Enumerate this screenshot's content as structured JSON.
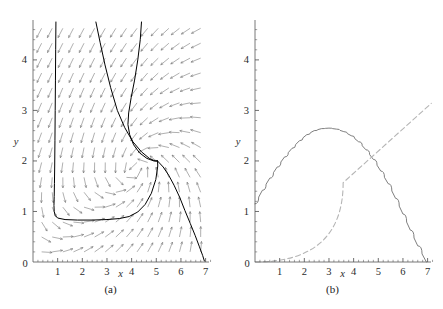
{
  "figure": {
    "background_color": "#ffffff",
    "panels": [
      {
        "id": "a",
        "caption": "(a)",
        "type": "phase-portrait",
        "xlabel": "x",
        "ylabel": "y",
        "xlim": [
          0,
          7.3
        ],
        "ylim": [
          0,
          4.75
        ],
        "xticks": [
          0,
          1,
          2,
          3,
          4,
          5,
          6,
          7
        ],
        "xtick_labels": [
          "0",
          "1",
          "2",
          "3",
          "4",
          "5",
          "6",
          "7"
        ],
        "yticks": [
          0,
          1,
          2,
          3,
          4
        ],
        "ytick_labels": [
          "0",
          "1",
          "2",
          "3",
          "4"
        ],
        "minor_ticks": true,
        "grid": false,
        "vector_field_color": "#6e6e6e",
        "trajectory_color": "#000000",
        "axis_color": "#555555",
        "equilibrium_point": [
          5.05,
          2.0
        ]
      },
      {
        "id": "b",
        "caption": "(b)",
        "type": "line",
        "xlabel": "x",
        "ylabel": "y",
        "xlim": [
          0,
          7.3
        ],
        "ylim": [
          0,
          4.75
        ],
        "xticks": [
          0,
          1,
          2,
          3,
          4,
          5,
          6,
          7
        ],
        "xtick_labels": [
          "0",
          "1",
          "2",
          "3",
          "4",
          "5",
          "6",
          "7"
        ],
        "yticks": [
          0,
          1,
          2,
          3,
          4
        ],
        "ytick_labels": [
          "0",
          "1",
          "2",
          "3",
          "4"
        ],
        "minor_ticks": true,
        "grid": false,
        "axis_color": "#555555"
      }
    ]
  },
  "chart_data": [
    {
      "type": "line",
      "panel": "a",
      "title": "",
      "xlabel": "x",
      "ylabel": "y",
      "xlim": [
        0,
        7.3
      ],
      "ylim": [
        0,
        4.75
      ],
      "grid": false,
      "legend": "none",
      "description": "Phase plane with direction field arrows and four solution trajectories converging toward a saddle-like point near (5, 2).",
      "series": [
        {
          "name": "trajectory-left-vertical",
          "color": "#000000",
          "style": "solid",
          "points": [
            [
              0.93,
              4.75
            ],
            [
              0.92,
              4.2
            ],
            [
              0.91,
              3.6
            ],
            [
              0.9,
              3.0
            ],
            [
              0.89,
              2.4
            ],
            [
              0.88,
              1.9
            ],
            [
              0.87,
              1.55
            ],
            [
              0.86,
              1.3
            ],
            [
              0.85,
              1.12
            ],
            [
              0.86,
              1.0
            ],
            [
              0.9,
              0.92
            ],
            [
              1.0,
              0.87
            ],
            [
              1.3,
              0.84
            ],
            [
              1.8,
              0.83
            ],
            [
              2.4,
              0.83
            ],
            [
              3.0,
              0.84
            ],
            [
              3.5,
              0.86
            ],
            [
              3.9,
              0.9
            ],
            [
              4.25,
              0.99
            ],
            [
              4.55,
              1.14
            ],
            [
              4.8,
              1.36
            ],
            [
              4.98,
              1.63
            ],
            [
              5.06,
              1.9
            ],
            [
              5.05,
              2.0
            ]
          ]
        },
        {
          "name": "trajectory-upper-middle",
          "color": "#000000",
          "style": "solid",
          "points": [
            [
              2.55,
              4.75
            ],
            [
              2.72,
              4.35
            ],
            [
              2.92,
              3.9
            ],
            [
              3.15,
              3.45
            ],
            [
              3.42,
              3.0
            ],
            [
              3.72,
              2.66
            ],
            [
              4.05,
              2.38
            ],
            [
              4.4,
              2.18
            ],
            [
              4.72,
              2.05
            ],
            [
              4.95,
              2.0
            ],
            [
              5.05,
              2.0
            ]
          ]
        },
        {
          "name": "trajectory-upper-right",
          "color": "#000000",
          "style": "solid",
          "points": [
            [
              4.4,
              4.75
            ],
            [
              4.35,
              4.4
            ],
            [
              4.25,
              4.0
            ],
            [
              4.12,
              3.6
            ],
            [
              3.98,
              3.25
            ],
            [
              3.88,
              2.95
            ],
            [
              3.85,
              2.72
            ],
            [
              3.92,
              2.52
            ],
            [
              4.08,
              2.32
            ],
            [
              4.32,
              2.16
            ],
            [
              4.62,
              2.05
            ],
            [
              4.9,
              2.0
            ],
            [
              5.05,
              2.0
            ]
          ]
        },
        {
          "name": "separatrix-descending",
          "color": "#000000",
          "style": "solid",
          "points": [
            [
              5.05,
              2.0
            ],
            [
              5.28,
              1.88
            ],
            [
              5.5,
              1.72
            ],
            [
              5.72,
              1.52
            ],
            [
              5.95,
              1.28
            ],
            [
              6.16,
              1.02
            ],
            [
              6.38,
              0.76
            ],
            [
              6.58,
              0.52
            ],
            [
              6.75,
              0.3
            ],
            [
              6.88,
              0.13
            ],
            [
              6.95,
              0.02
            ]
          ]
        }
      ],
      "vector_field": {
        "x_start": 0.35,
        "x_step": 0.43,
        "x_count": 16,
        "y_start": 0.2,
        "y_step": 0.295,
        "y_count": 16,
        "color": "#6e6e6e",
        "description": "Normalized direction field arrows; flow turns clockwise around equilibrium near (5,2)."
      }
    },
    {
      "type": "line",
      "panel": "b",
      "title": "",
      "xlabel": "x",
      "ylabel": "y",
      "xlim": [
        0,
        7.3
      ],
      "ylim": [
        0,
        4.75
      ],
      "grid": false,
      "legend": "none",
      "description": "Nullcline plot: a downward parabola-like curve starting at (0, 1.15), peaking near (3.05, 2.65), meeting the x-axis near (6.95, 0); and a straight dashed line of slope ~0.44 through the origin.",
      "series": [
        {
          "name": "parabolic-nullcline",
          "color": "#707070",
          "style": "solid",
          "x": [
            0,
            0.3,
            0.6,
            0.9,
            1.2,
            1.5,
            1.8,
            2.1,
            2.4,
            2.7,
            3.0,
            3.3,
            3.6,
            3.9,
            4.2,
            4.5,
            4.8,
            5.1,
            5.4,
            5.7,
            6.0,
            6.3,
            6.6,
            6.95
          ],
          "y": [
            1.15,
            1.42,
            1.66,
            1.88,
            2.08,
            2.25,
            2.4,
            2.52,
            2.6,
            2.64,
            2.65,
            2.63,
            2.58,
            2.5,
            2.38,
            2.22,
            2.03,
            1.8,
            1.55,
            1.26,
            0.95,
            0.63,
            0.32,
            0.0
          ]
        },
        {
          "name": "linear-nullcline",
          "color": "#b5b5b5",
          "style": "dashed",
          "x": [
            0,
            7.15
          ],
          "y": [
            0,
            3.14
          ]
        }
      ],
      "intersections": [
        [
          5.07,
          2.0
        ]
      ]
    }
  ]
}
